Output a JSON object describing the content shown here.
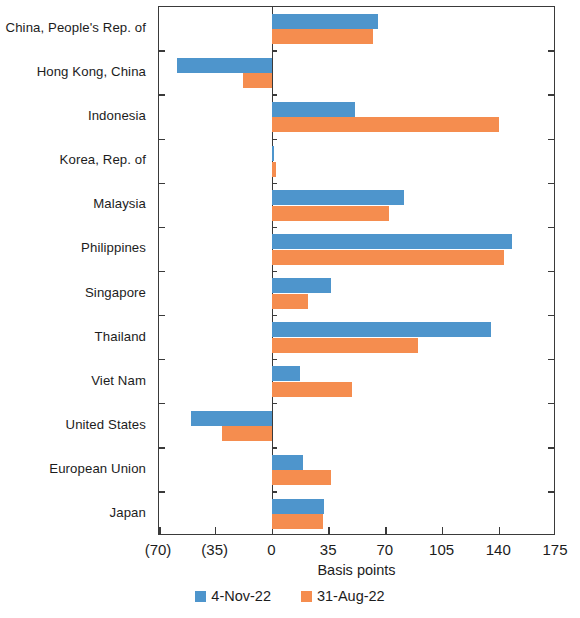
{
  "chart_data": {
    "type": "bar",
    "orientation": "horizontal",
    "title": "",
    "xlabel": "Basis points",
    "ylabel": "",
    "xlim": [
      -70,
      175
    ],
    "xticks": [
      -70,
      -35,
      0,
      35,
      70,
      105,
      140,
      175
    ],
    "xtick_labels": [
      "(70)",
      "(35)",
      "0",
      "35",
      "70",
      "105",
      "140",
      "175"
    ],
    "grid": false,
    "legend_position": "bottom",
    "categories": [
      "China, People's Rep. of",
      "Hong Kong, China",
      "Indonesia",
      "Korea, Rep. of",
      "Malaysia",
      "Philippines",
      "Singapore",
      "Thailand",
      "Viet Nam",
      "United States",
      "European Union",
      "Japan"
    ],
    "series": [
      {
        "name": "4-Nov-22",
        "color": "#4e95cc",
        "values": [
          65,
          -59,
          51,
          1,
          81,
          148,
          36,
          135,
          17,
          -50,
          19,
          32
        ]
      },
      {
        "name": "31-Aug-22",
        "color": "#f58d4f",
        "values": [
          62,
          -18,
          140,
          2,
          72,
          143,
          22,
          90,
          49,
          -31,
          36,
          31
        ]
      }
    ]
  },
  "legend": {
    "items": [
      {
        "label": "4-Nov-22",
        "color": "#4e95cc"
      },
      {
        "label": "31-Aug-22",
        "color": "#f58d4f"
      }
    ]
  }
}
